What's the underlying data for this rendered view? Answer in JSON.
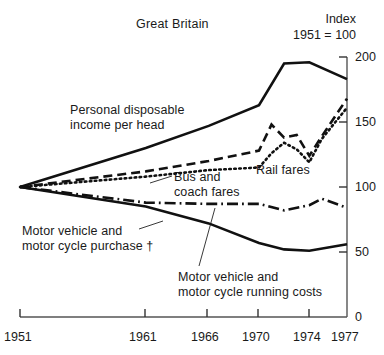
{
  "header": {
    "title": "Great Britain",
    "index_caption_line1": "Index",
    "index_caption_line2": "1951 = 100"
  },
  "annotations": {
    "personal_income": "Personal disposable\nincome per head",
    "bus_coach": "Bus and\ncoach fares",
    "rail_fares": "Rail fares",
    "purchase": "Motor vehicle and\nmotor cycle purchase †",
    "running_costs": "Motor vehicle and\nmotor cycle running costs"
  },
  "chart_data": {
    "type": "line",
    "title": "Great Britain",
    "subtitle": "Index 1951 = 100",
    "xlabel": "",
    "ylabel": "Index 1951 = 100",
    "xlim": [
      1951,
      1977
    ],
    "ylim": [
      0,
      200
    ],
    "yticks": [
      0,
      50,
      100,
      150,
      200
    ],
    "xticks": [
      1951,
      1961,
      1966,
      1970,
      1974,
      1977
    ],
    "grid": false,
    "legend": "inline-annotations",
    "axis_position": "right",
    "footnote_marker": "†",
    "series": [
      {
        "name": "Personal disposable income per head",
        "style": "solid",
        "x": [
          1951,
          1961,
          1966,
          1970,
          1972,
          1974,
          1977
        ],
        "values": [
          100,
          130,
          147,
          163,
          195,
          196,
          183
        ]
      },
      {
        "name": "Bus and coach fares",
        "style": "dashed",
        "x": [
          1951,
          1961,
          1966,
          1970,
          1971,
          1972,
          1973,
          1974,
          1975,
          1977
        ],
        "values": [
          100,
          112,
          120,
          128,
          148,
          138,
          140,
          124,
          139,
          168
        ]
      },
      {
        "name": "Rail fares",
        "style": "dotted",
        "x": [
          1951,
          1961,
          1966,
          1970,
          1971,
          1972,
          1973,
          1974,
          1975,
          1977
        ],
        "values": [
          100,
          108,
          113,
          115,
          126,
          134,
          129,
          119,
          137,
          161
        ]
      },
      {
        "name": "Motor vehicle and motor cycle running costs",
        "style": "dash-dot",
        "x": [
          1951,
          1961,
          1966,
          1970,
          1972,
          1974,
          1975,
          1977
        ],
        "values": [
          100,
          88,
          87,
          87,
          82,
          86,
          91,
          84
        ]
      },
      {
        "name": "Motor vehicle and motor cycle purchase",
        "style": "solid",
        "x": [
          1951,
          1961,
          1966,
          1970,
          1972,
          1974,
          1977
        ],
        "values": [
          100,
          85,
          72,
          57,
          52,
          51,
          56
        ]
      }
    ]
  },
  "axis_labels": {
    "y": [
      "200",
      "150",
      "100",
      "50",
      "0"
    ],
    "x": [
      "1951",
      "1961",
      "1966",
      "1970",
      "1974",
      "1977"
    ]
  }
}
